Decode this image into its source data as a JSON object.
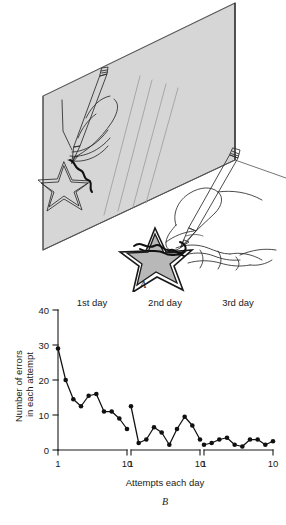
{
  "figure": {
    "panel_a": {
      "label": "A",
      "scene_name": "mirror-drawing-star-tracing-task",
      "elements": {
        "mirror_name": "mirror-panel",
        "mirror_fill": "#d6d6d6",
        "mirror_edge": "#4a4a4a",
        "reflected_star_name": "reflected-star-outline",
        "reflected_pencil_name": "reflected-pencil",
        "reflected_hand_name": "reflected-hand",
        "table_star_name": "table-star-shape",
        "table_star_fill": "#b8b8b8",
        "pencil_name": "pencil",
        "hand_name": "hand-holding-pencil",
        "trace_error_name": "traced-error-scribble"
      }
    },
    "panel_b": {
      "label": "B",
      "ylabel_line1": "Number of errors",
      "ylabel_line2": "in each attempt",
      "xlabel": "Attempts each day",
      "y_ticks": [
        "0",
        "10",
        "20",
        "30",
        "40"
      ],
      "x_ticks": [
        "1",
        "10"
      ],
      "day_labels": [
        "1st day",
        "2nd day",
        "3rd day"
      ]
    }
  },
  "chart_data": {
    "type": "line",
    "title": "",
    "subtitle": "",
    "xlabel": "Attempts each day",
    "ylabel": "Number of errors in each attempt",
    "ylim": [
      0,
      40
    ],
    "xlim": [
      1,
      10
    ],
    "y_ticks": [
      0,
      10,
      20,
      30,
      40
    ],
    "x_ticks": [
      1,
      10
    ],
    "grid": false,
    "legend": "none",
    "annotations": [
      "1st day",
      "2nd day",
      "3rd day"
    ],
    "x": [
      1,
      2,
      3,
      4,
      5,
      6,
      7,
      8,
      9,
      10
    ],
    "series": [
      {
        "name": "1st day",
        "values": [
          29,
          20,
          14.5,
          12.5,
          15.5,
          16,
          11,
          11,
          9,
          6
        ]
      },
      {
        "name": "2nd day",
        "values": [
          12.5,
          2,
          3,
          6.5,
          5,
          1.5,
          6,
          9.5,
          7,
          3
        ]
      },
      {
        "name": "3rd day",
        "values": [
          1.5,
          2,
          3,
          3.5,
          1.5,
          1,
          3,
          3,
          1.5,
          2.5
        ]
      }
    ]
  }
}
